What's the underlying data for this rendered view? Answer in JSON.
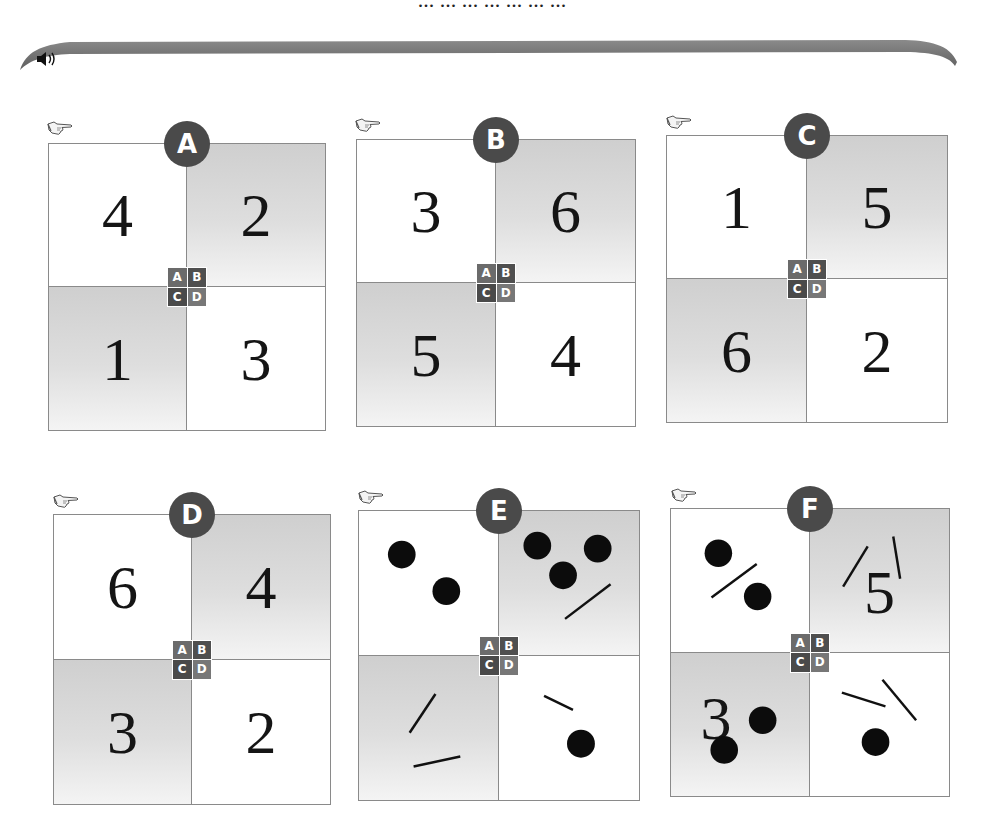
{
  "header": {
    "cut_off_text": "... ... ... ... ... ... ...",
    "speaker_icon": "speaker-audio-icon"
  },
  "mini_grid_labels": [
    "A",
    "B",
    "C",
    "D"
  ],
  "cards": [
    {
      "label": "A",
      "quadrants": {
        "A": {
          "type": "number",
          "value": "4"
        },
        "B": {
          "type": "number",
          "value": "2"
        },
        "C": {
          "type": "number",
          "value": "1"
        },
        "D": {
          "type": "number",
          "value": "3"
        }
      }
    },
    {
      "label": "B",
      "quadrants": {
        "A": {
          "type": "number",
          "value": "3"
        },
        "B": {
          "type": "number",
          "value": "6"
        },
        "C": {
          "type": "number",
          "value": "5"
        },
        "D": {
          "type": "number",
          "value": "4"
        }
      }
    },
    {
      "label": "C",
      "quadrants": {
        "A": {
          "type": "number",
          "value": "1"
        },
        "B": {
          "type": "number",
          "value": "5"
        },
        "C": {
          "type": "number",
          "value": "6"
        },
        "D": {
          "type": "number",
          "value": "2"
        }
      }
    },
    {
      "label": "D",
      "quadrants": {
        "A": {
          "type": "number",
          "value": "6"
        },
        "B": {
          "type": "number",
          "value": "4"
        },
        "C": {
          "type": "number",
          "value": "3"
        },
        "D": {
          "type": "number",
          "value": "2"
        }
      }
    },
    {
      "label": "E",
      "quadrants": {
        "A": {
          "type": "tally",
          "dots": 2,
          "strokes": 0
        },
        "B": {
          "type": "tally",
          "dots": 3,
          "strokes": 1
        },
        "C": {
          "type": "tally",
          "dots": 0,
          "strokes": 2
        },
        "D": {
          "type": "tally",
          "dots": 1,
          "strokes": 1
        }
      }
    },
    {
      "label": "F",
      "quadrants": {
        "A": {
          "type": "tally",
          "dots": 2,
          "strokes": 1
        },
        "B": {
          "type": "mixed",
          "value": "5",
          "strokes": 2
        },
        "C": {
          "type": "mixed",
          "value": "3",
          "dots": 2
        },
        "D": {
          "type": "tally",
          "dots": 1,
          "strokes": 2
        }
      }
    }
  ],
  "colors": {
    "badge": "#4a4a4a",
    "border": "#8a8a8a",
    "gray_quadrant": "#cfcfcf",
    "banner": "#6e6e6e",
    "ink": "#151515"
  }
}
